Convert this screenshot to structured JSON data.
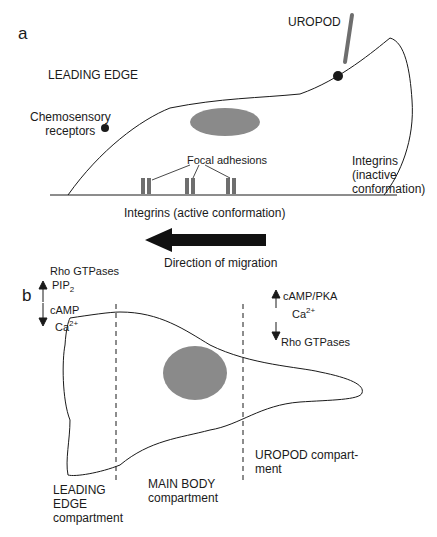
{
  "panel_a": {
    "letter": "a",
    "leading_edge": "LEADING EDGE",
    "uropod": "UROPOD",
    "chemosensory_line1": "Chemosensory",
    "chemosensory_line2": "receptors",
    "focal_adhesions": "Focal adhesions",
    "integrins_active": "Integrins (active conformation)",
    "integrins_inactive_line1": "Integrins",
    "integrins_inactive_line2": "(inactive",
    "integrins_inactive_line3": "conformation)",
    "direction": "Direction of migration"
  },
  "panel_b": {
    "letter": "b",
    "le_up1": "Rho GTPases",
    "le_up2": "PIP",
    "le_up2_sub": "2",
    "le_down1": "cAMP",
    "le_down2": "Ca",
    "le_down2_sup": "2+",
    "ur_up1": "cAMP/PKA",
    "ur_up2": "Ca",
    "ur_up2_sup": "2+",
    "ur_down1": "Rho GTPases",
    "le_comp1": "LEADING",
    "le_comp2": "EDGE",
    "le_comp3": "compartment",
    "mb_comp1": "MAIN BODY",
    "mb_comp2": "compartment",
    "ur_comp1": "UROPOD compart-",
    "ur_comp2": "ment"
  },
  "colors": {
    "nucleus": "#8a8a8a",
    "line": "#1a1a1a",
    "integrin": "#6e6e6e"
  }
}
